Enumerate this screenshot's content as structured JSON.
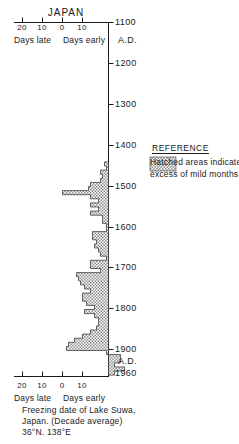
{
  "title": "JAPAN",
  "axis": {
    "x_ticks_top": [
      {
        "label": "20",
        "x": 22
      },
      {
        "label": "10",
        "x": 42
      },
      {
        "label": "0",
        "x": 62
      },
      {
        "label": "10",
        "x": 82
      }
    ],
    "x_ticks_bottom": [
      {
        "label": "20",
        "x": 22
      },
      {
        "label": "10",
        "x": 42
      },
      {
        "label": "0",
        "x": 62
      },
      {
        "label": "10",
        "x": 82
      }
    ],
    "days_late_label": "Days late",
    "days_early_label": "Days early",
    "year_ticks": [
      {
        "label": "1100",
        "y": 22
      },
      {
        "label": "1200",
        "y": 63
      },
      {
        "label": "1300",
        "y": 104
      },
      {
        "label": "1400",
        "y": 145
      },
      {
        "label": "1500",
        "y": 186
      },
      {
        "label": "1600",
        "y": 227
      },
      {
        "label": "1700",
        "y": 267
      },
      {
        "label": "1800",
        "y": 308
      },
      {
        "label": "1900",
        "y": 349
      },
      {
        "label": "1960",
        "y": 373
      }
    ],
    "ad_labels": [
      {
        "label": "A.D.",
        "y": 40
      },
      {
        "label": "A.D.",
        "y": 361
      }
    ]
  },
  "reference": {
    "heading": "REFERENCE",
    "line1": "Hatched areas indicate",
    "line2": "excess of mild months",
    "swatch_name": "hatched-swatch"
  },
  "caption": {
    "line1": "Freezing date of Lake Suwa,",
    "line2": "Japan. (Decade average)",
    "line3": "36°N. 138°E"
  },
  "colors": {
    "ink": "#1a1a1a",
    "hatch": "#9a9a9a",
    "background": "#ffffff"
  },
  "chart_data": {
    "type": "bar",
    "orientation": "horizontal",
    "title": "JAPAN",
    "xlabel": "Days late  /  Days early",
    "ylabel": "A.D. Year",
    "xlim": [
      -12,
      24
    ],
    "ylim": [
      1100,
      1960
    ],
    "grid": false,
    "legend": "Hatched areas indicate excess of mild months",
    "x_axis_note": "Values are days late (positive, plotted to the left of zero) or days early (plotted to the right of zero) relative to the mean freezing date",
    "x_tick_values": [
      20,
      10,
      0,
      10
    ],
    "y_tick_values": [
      1100,
      1200,
      1300,
      1400,
      1500,
      1600,
      1700,
      1800,
      1900,
      1960
    ],
    "categories": [
      1440,
      1450,
      1460,
      1470,
      1480,
      1490,
      1500,
      1510,
      1520,
      1530,
      1540,
      1550,
      1560,
      1570,
      1580,
      1590,
      1600,
      1610,
      1620,
      1630,
      1640,
      1650,
      1660,
      1670,
      1680,
      1690,
      1700,
      1710,
      1720,
      1730,
      1740,
      1750,
      1760,
      1770,
      1780,
      1790,
      1800,
      1810,
      1820,
      1830,
      1840,
      1850,
      1860,
      1870,
      1880,
      1890,
      1900,
      1910,
      1920,
      1930,
      1940,
      1950
    ],
    "values": [
      2,
      1,
      4,
      3,
      4,
      9,
      10,
      23,
      9,
      5,
      9,
      5,
      9,
      3,
      3,
      1,
      1,
      8,
      8,
      6,
      7,
      5,
      4,
      1,
      9,
      9,
      4,
      16,
      15,
      14,
      12,
      9,
      13,
      13,
      11,
      7,
      12,
      7,
      5,
      5,
      6,
      9,
      13,
      17,
      20,
      21,
      1,
      -6,
      -6,
      -3,
      -8,
      -3
    ]
  }
}
